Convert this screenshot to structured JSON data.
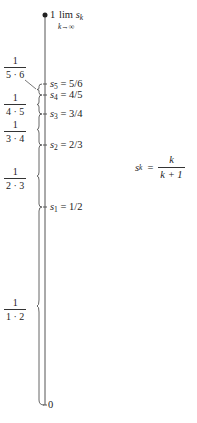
{
  "diagram": {
    "axis": {
      "top_label": "1",
      "top_limit_text": "lim",
      "top_limit_var": "s",
      "top_limit_sub": "k",
      "top_limit_under": "k→∞",
      "bottom_label": "0"
    },
    "points": [
      {
        "var": "s",
        "sub": "5",
        "eq": "=",
        "value": "5/6"
      },
      {
        "var": "s",
        "sub": "4",
        "eq": "=",
        "value": "4/5"
      },
      {
        "var": "s",
        "sub": "3",
        "eq": "=",
        "value": "3/4"
      },
      {
        "var": "s",
        "sub": "2",
        "eq": "=",
        "value": "2/3"
      },
      {
        "var": "s",
        "sub": "1",
        "eq": "=",
        "value": "1/2"
      }
    ],
    "braces": [
      {
        "num": "1",
        "den": "5 · 6"
      },
      {
        "num": "1",
        "den": "4 · 5"
      },
      {
        "num": "1",
        "den": "3 · 4"
      },
      {
        "num": "1",
        "den": "2 · 3"
      },
      {
        "num": "1",
        "den": "1 · 2"
      }
    ],
    "formula": {
      "lhs_var": "s",
      "lhs_sub": "k",
      "eq": "=",
      "num": "k",
      "den": "k + 1"
    }
  },
  "colors": {
    "line": "#555555",
    "text": "#222222",
    "background": "#ffffff"
  }
}
